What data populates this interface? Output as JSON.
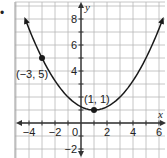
{
  "bullet": "•",
  "chart_data": {
    "type": "line",
    "title": "",
    "xlabel": "x",
    "ylabel": "y",
    "xlim": [
      -5,
      6.5
    ],
    "ylim": [
      -3,
      9
    ],
    "grid": true,
    "x_ticks": [
      -4,
      -2,
      0,
      2,
      4,
      6
    ],
    "y_ticks": [
      8,
      6,
      4,
      -2
    ],
    "tick_labels": {
      "x": [
        "−4",
        "−2",
        "0",
        "2",
        "4",
        "6"
      ],
      "y": [
        "8",
        "6",
        "4",
        "−2"
      ]
    },
    "series": [
      {
        "name": "parabola",
        "equation": "y = (x - 1)^2 / 4 + 1",
        "x": [
          -4.3,
          -3,
          -2,
          -1,
          0,
          1,
          2,
          3,
          4,
          5,
          6.2
        ],
        "y": [
          8.02,
          5,
          3.25,
          2,
          1.25,
          1,
          1.25,
          2,
          3.25,
          5,
          7.76
        ],
        "color": "#1a1a1a"
      }
    ],
    "points": [
      {
        "x": -3,
        "y": 5,
        "label": "(−3, 5)"
      },
      {
        "x": 1,
        "y": 1,
        "label": "(1, 1)"
      }
    ],
    "colors": {
      "grid": "#b8b8b8",
      "axis": "#333333",
      "curve": "#1a1a1a",
      "border": "#9a9a9a"
    }
  }
}
